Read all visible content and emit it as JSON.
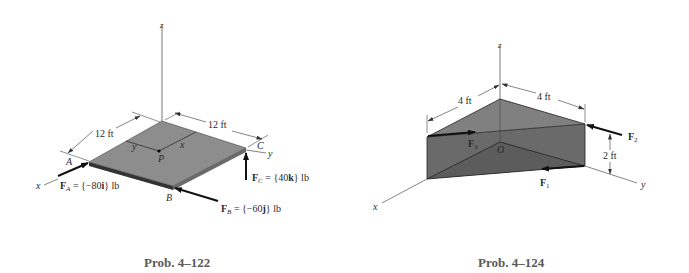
{
  "figures": [
    {
      "id": "prob-4-122",
      "caption": "Prob. 4–122",
      "axes": {
        "x": "x",
        "y": "y",
        "z": "z"
      },
      "dimensions": {
        "edge_ax": "12 ft",
        "edge_ay": "12 ft"
      },
      "points": {
        "A": "A",
        "B": "B",
        "C": "C",
        "P": "P",
        "px": "x",
        "py": "y"
      },
      "forces": {
        "FA": {
          "sym": "F",
          "sub": "A",
          "value": " = {−80",
          "unit": "i",
          "tail": "} lb"
        },
        "FB": {
          "sym": "F",
          "sub": "B",
          "value": " = {−60",
          "unit": "j",
          "tail": "} lb"
        },
        "FC": {
          "sym": "F",
          "sub": "C",
          "value": " = {40",
          "unit": "k",
          "tail": "} lb"
        }
      }
    },
    {
      "id": "prob-4-124",
      "caption": "Prob. 4–124",
      "axes": {
        "x": "x",
        "y": "y",
        "z": "z"
      },
      "dimensions": {
        "left_top": "4 ft",
        "right_top": "4 ft",
        "height": "2 ft"
      },
      "points": {
        "O": "O"
      },
      "forces": {
        "F1": {
          "sym": "F",
          "sub": "1"
        },
        "F2": {
          "sym": "F",
          "sub": "2"
        },
        "F3": {
          "sym": "F",
          "sub": "3"
        }
      }
    }
  ],
  "colors": {
    "plate": "#8a8a8a",
    "plate_edge": "#3a3a3a",
    "wedge_front": "#666666",
    "wedge_top": "#7e7e7e",
    "line": "#555555",
    "caption": "#5a5a5a"
  }
}
